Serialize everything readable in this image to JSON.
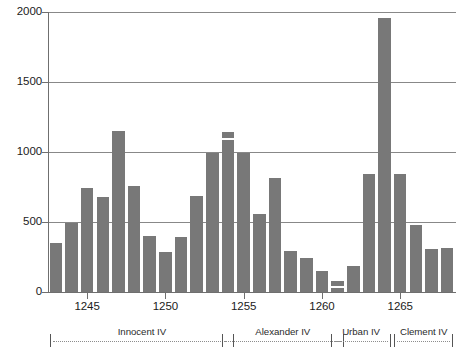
{
  "chart_data": {
    "type": "bar",
    "title": "",
    "subtitle": "",
    "xlabel": "",
    "ylabel": "",
    "ylim": [
      0,
      2000
    ],
    "yticks": [
      0,
      500,
      1000,
      1500,
      2000
    ],
    "ytick_labels": [
      "0",
      "500",
      "1000",
      "1500",
      "2000"
    ],
    "xticks": [
      1245,
      1250,
      1255,
      1260,
      1265
    ],
    "xtick_labels": [
      "1245",
      "1250",
      "1255",
      "1260",
      "1265"
    ],
    "grid": "horizontal",
    "legend": "none",
    "bar_color": "#787878",
    "axis_color": "#6f6f6f",
    "grid_color": "#888888",
    "categories": [
      "1243",
      "1244",
      "1245",
      "1246",
      "1247",
      "1248",
      "1249",
      "1250",
      "1251",
      "1252",
      "1253",
      "1254",
      "1255",
      "1256",
      "1257",
      "1258",
      "1259",
      "1260",
      "1261",
      "1262",
      "1263",
      "1264",
      "1265",
      "1266",
      "1267",
      "1268"
    ],
    "values": [
      350,
      490,
      740,
      680,
      1150,
      755,
      400,
      285,
      390,
      685,
      995,
      1140,
      995,
      555,
      815,
      290,
      240,
      150,
      80,
      185,
      845,
      1960,
      840,
      480,
      305,
      315
    ],
    "split_markers": [
      {
        "category": "1254",
        "at_value": 1100
      },
      {
        "category": "1261",
        "at_value": 45
      }
    ],
    "annotations": [
      {
        "label": "Innocent IV",
        "start": "1243",
        "end": "1254"
      },
      {
        "label": "Alexander IV",
        "start": "1254",
        "end": "1261"
      },
      {
        "label": "Urban IV",
        "start": "1261",
        "end": "1264"
      },
      {
        "label": "Clement IV",
        "start": "1265",
        "end": "1268"
      }
    ]
  },
  "reign_bands": [
    {
      "label": "Innocent IV"
    },
    {
      "label": "Alexander IV"
    },
    {
      "label": "Urban IV"
    },
    {
      "label": "Clement IV"
    }
  ]
}
